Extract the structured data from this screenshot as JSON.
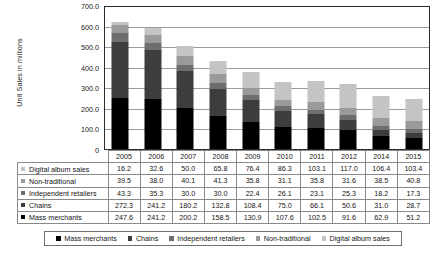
{
  "chart_data": {
    "type": "bar",
    "stacked": true,
    "title": "",
    "xlabel": "",
    "ylabel": "Unit Sales in millions",
    "ylim": [
      0,
      700
    ],
    "ytick_step": 100,
    "ytick_labels": [
      "700.0",
      "600.0",
      "500.0",
      "400.0",
      "300.0",
      "200.0",
      "100.0",
      "0"
    ],
    "grid": true,
    "legend_position": "bottom",
    "categories": [
      "2005",
      "2006",
      "2007",
      "2008",
      "2009",
      "2010",
      "2011",
      "2012",
      "2014",
      "2015"
    ],
    "series": [
      {
        "name": "Mass merchants",
        "color": "#000000",
        "values": [
          247.6,
          241.2,
          200.2,
          158.5,
          130.9,
          107.6,
          102.5,
          91.6,
          62.9,
          51.2
        ]
      },
      {
        "name": "Chains",
        "color": "#3d3d3d",
        "values": [
          272.3,
          241.2,
          180.2,
          132.8,
          108.4,
          75.0,
          66.1,
          50.6,
          31.0,
          28.7
        ]
      },
      {
        "name": "Independent retailers",
        "color": "#6e6e6e",
        "values": [
          43.3,
          35.3,
          30.0,
          30.0,
          22.4,
          26.1,
          23.1,
          25.3,
          18.2,
          17.3
        ]
      },
      {
        "name": "Non-traditional",
        "color": "#9a9a9a",
        "values": [
          39.5,
          38.0,
          40.1,
          41.3,
          35.8,
          31.1,
          35.8,
          31.6,
          38.5,
          40.8
        ]
      },
      {
        "name": "Digital album sales",
        "color": "#c4c4c4",
        "values": [
          16.2,
          32.6,
          50.0,
          65.8,
          76.4,
          86.3,
          103.1,
          117.0,
          106.4,
          103.4
        ]
      }
    ]
  },
  "table": {
    "year_header": [
      "2005",
      "2006",
      "2007",
      "2008",
      "2009",
      "2010",
      "2011",
      "2012",
      "2014",
      "2015"
    ],
    "rows": [
      {
        "label": "Digital album sales",
        "color": "#c4c4c4",
        "values": [
          "16.2",
          "32.6",
          "50.0",
          "65.8",
          "76.4",
          "86.3",
          "103.1",
          "117.0",
          "106.4",
          "103.4"
        ]
      },
      {
        "label": "Non-traditional",
        "color": "#9a9a9a",
        "values": [
          "39.5",
          "38.0",
          "40.1",
          "41.3",
          "35.8",
          "31.1",
          "35.8",
          "31.6",
          "38.5",
          "40.8"
        ]
      },
      {
        "label": "Independent retailers",
        "color": "#6e6e6e",
        "values": [
          "43.3",
          "35.3",
          "30.0",
          "30.0",
          "22.4",
          "26.1",
          "23.1",
          "25.3",
          "18.2",
          "17.3"
        ]
      },
      {
        "label": "Chains",
        "color": "#3d3d3d",
        "values": [
          "272.3",
          "241.2",
          "180.2",
          "132.8",
          "108.4",
          "75.0",
          "66.1",
          "50.6",
          "31.0",
          "28.7"
        ]
      },
      {
        "label": "Mass merchants",
        "color": "#000000",
        "values": [
          "247.6",
          "241.2",
          "200.2",
          "158.5",
          "130.9",
          "107.6",
          "102.5",
          "91.6",
          "62.9",
          "51.2"
        ]
      }
    ]
  },
  "legend": {
    "items": [
      {
        "label": "Mass merchants",
        "color": "#000000"
      },
      {
        "label": "Chains",
        "color": "#3d3d3d"
      },
      {
        "label": "Independent retailers",
        "color": "#6e6e6e"
      },
      {
        "label": "Non-traditional",
        "color": "#9a9a9a"
      },
      {
        "label": "Digital album sales",
        "color": "#c4c4c4"
      }
    ]
  }
}
